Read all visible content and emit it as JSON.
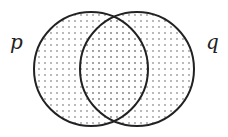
{
  "diagram": {
    "type": "venn",
    "sets": [
      {
        "label": "p",
        "cx": 91,
        "cy": 69,
        "r": 57
      },
      {
        "label": "q",
        "cx": 137,
        "cy": 69,
        "r": 57
      }
    ],
    "shaded_region": "p ∪ q",
    "fill_pattern": "dots",
    "colors": {
      "stroke": "#222222",
      "dot": "#999999"
    }
  }
}
